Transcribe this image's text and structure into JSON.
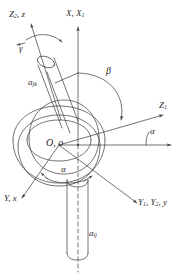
{
  "figure": {
    "kind": "engineering-line-drawing",
    "ink_color": "#3a3a3a",
    "background_color": "#ffffff"
  },
  "labels": {
    "axis_z2_z": {
      "text": "Z₂, z",
      "base": "Z",
      "sub": "2",
      "rest": ", z"
    },
    "axis_x_x1": {
      "text": "X, X₁",
      "base": "X, X",
      "sub": "1",
      "rest": ""
    },
    "axis_z1": {
      "text": "Z₁",
      "base": "Z",
      "sub": "1",
      "rest": ""
    },
    "axis_y_x": {
      "text": "Y, x",
      "base": "Y, x",
      "sub": "",
      "rest": ""
    },
    "axis_y1_y2_y": {
      "text": "Y₁, Y₂, y",
      "base": "Y",
      "sub": "1",
      "rest": ", Y"
    },
    "origin": {
      "text": "O, o"
    },
    "angle_gamma": {
      "text": "γ"
    },
    "angle_beta": {
      "text": "β"
    },
    "angle_alpha_right": {
      "text": "α"
    },
    "angle_alpha_bottom": {
      "text": "α"
    },
    "member_upper": {
      "base": "a",
      "sub": "jk"
    },
    "member_lower": {
      "base": "a",
      "sub": "ij"
    }
  },
  "axes": [
    {
      "name": "X, X1",
      "direction": "vertical up",
      "arrow": true
    },
    {
      "name": "Z1",
      "direction": "upper right",
      "arrow": true
    },
    {
      "name": "Z2, z",
      "direction": "upper left",
      "arrow": true
    },
    {
      "name": "Y, x",
      "direction": "lower left",
      "arrow": true
    },
    {
      "name": "Y1, Y2, y",
      "direction": "lower right",
      "arrow": true
    },
    {
      "name": "horizontal reference",
      "direction": "right",
      "arrow": true
    }
  ],
  "angles": [
    {
      "symbol": "α",
      "between": "horizontal reference and Z1 axis"
    },
    {
      "symbol": "β",
      "between": "X axis and upper member a_jk"
    },
    {
      "symbol": "γ",
      "about": "Z2 / z axis"
    },
    {
      "symbol": "α",
      "about": "vertical axis at torus"
    }
  ]
}
